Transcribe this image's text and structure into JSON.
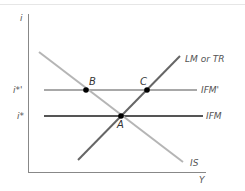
{
  "diagram": {
    "axes": {
      "y_label": "i",
      "x_label": "Y",
      "tick_labels": {
        "i_star_prime": "i*'",
        "i_star": "i*"
      }
    },
    "curves": {
      "lm": {
        "label": "LM or TR",
        "color": "#555555"
      },
      "is": {
        "label": "IS",
        "color": "#b3b3b3"
      },
      "ifm_prime": {
        "label": "IFM'",
        "color": "#a6a6a6"
      },
      "ifm": {
        "label": "IFM",
        "color": "#555555"
      }
    },
    "points": {
      "a": "A",
      "b": "B",
      "c": "C"
    }
  }
}
